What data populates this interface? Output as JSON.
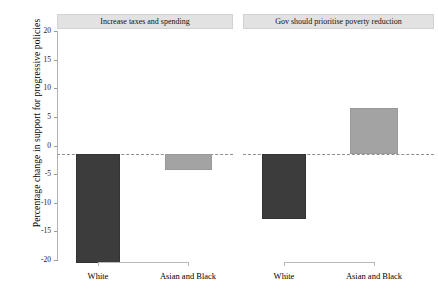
{
  "chart_data": {
    "type": "bar",
    "title": "",
    "subtitle": "",
    "xlabel": "",
    "ylabel": "Percentage change in support for progressive policies",
    "ylim": [
      -20,
      20
    ],
    "yticks": [
      20,
      15,
      10,
      5,
      0,
      -5,
      -10,
      -15,
      -20
    ],
    "ytick_labels": [
      "20",
      "15",
      "10",
      "5",
      "0",
      "-5",
      "-10",
      "-15",
      "-20"
    ],
    "grid": false,
    "legend": "none",
    "zero_reference_line": 0,
    "categories": [
      "White",
      "Asian and Black"
    ],
    "panels": [
      {
        "title": "Increase taxes and spending",
        "bars": [
          {
            "category": "White",
            "value": -17.8,
            "color": "#3c3c3c"
          },
          {
            "category": "Asian and Black",
            "value": -2.6,
            "color": "#a3a3a3"
          }
        ]
      },
      {
        "title": "Gov should prioritise poverty reduction",
        "bars": [
          {
            "category": "White",
            "value": -10.5,
            "color": "#3c3c3c"
          },
          {
            "category": "Asian and Black",
            "value": 7.5,
            "color": "#a3a3a3"
          }
        ]
      }
    ],
    "colors": {
      "bar_dark": "#3c3c3c",
      "bar_light": "#a3a3a3",
      "strip_background": "#e2e2e2",
      "axis": "#b2b2b2",
      "zero_line": "#8e8e8e",
      "background": "#ffffff"
    }
  }
}
